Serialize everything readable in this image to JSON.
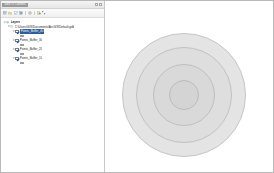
{
  "window": {
    "background": "#ffffff",
    "border_color": "#b9b9b9"
  },
  "toc_panel": {
    "title": "Table Of Contents",
    "pin_button_label": "",
    "close_button_label": "",
    "toolbar": {
      "items": [
        {
          "name": "list-by-drawing-order-icon",
          "label": "List By Drawing Order"
        },
        {
          "name": "list-by-source-icon",
          "label": "List By Source"
        },
        {
          "name": "list-by-visibility-icon",
          "label": "List By Visibility"
        },
        {
          "name": "list-by-selection-icon",
          "label": "List By Selection"
        },
        {
          "name": "options-icon",
          "label": "Options"
        },
        {
          "name": "add-data-icon",
          "label": "Add Data"
        },
        {
          "name": "toggle-all-icon",
          "label": "Toggle All Layers"
        }
      ]
    },
    "tree": [
      {
        "id": "layers-root",
        "indent": 0,
        "label": "Layers",
        "expanded": true,
        "checked": true,
        "selected": false,
        "kind": "root",
        "has_symbol": false
      },
      {
        "id": "gdb-group",
        "indent": 1,
        "label": "C:\\Users\\GIS\\Documents\\ArcGIS\\Default.gdb",
        "expanded": true,
        "checked": true,
        "selected": false,
        "kind": "group",
        "has_symbol": false
      },
      {
        "id": "points-buffer-4",
        "indent": 2,
        "label": "Points_Buffer_40",
        "expanded": true,
        "checked": true,
        "selected": true,
        "kind": "layer",
        "has_symbol": true,
        "symbol_fill": "#e3e3e3",
        "symbol_outline": "#9d9d9d"
      },
      {
        "id": "points-buffer-3",
        "indent": 2,
        "label": "Points_Buffer_30",
        "expanded": true,
        "checked": true,
        "selected": false,
        "kind": "layer",
        "has_symbol": true,
        "symbol_fill": "#dedede",
        "symbol_outline": "#9d9d9d"
      },
      {
        "id": "points-buffer-2",
        "indent": 2,
        "label": "Points_Buffer_20",
        "expanded": true,
        "checked": true,
        "selected": false,
        "kind": "layer",
        "has_symbol": true,
        "symbol_fill": "#d9d9d9",
        "symbol_outline": "#9d9d9d"
      },
      {
        "id": "points-buffer-10",
        "indent": 2,
        "label": "Points_Buffer_10",
        "expanded": true,
        "checked": true,
        "selected": false,
        "kind": "layer",
        "has_symbol": true,
        "symbol_fill": "#d2d2d2",
        "symbol_outline": "#9d9d9d"
      }
    ]
  },
  "map_view": {
    "background": "#ffffff",
    "graphic": {
      "type": "multi-ring-buffer",
      "center_x_pct": 47,
      "center_y_pct": 55,
      "rings": [
        {
          "name": "buffer-ring-40",
          "diameter_px": 124,
          "fill": "#e4e4e4",
          "outline": "#c6c6c6"
        },
        {
          "name": "buffer-ring-30",
          "diameter_px": 96,
          "fill": "#dedede",
          "outline": "#c2c2c2"
        },
        {
          "name": "buffer-ring-20",
          "diameter_px": 62,
          "fill": "#d9d9d9",
          "outline": "#bfbfbf"
        },
        {
          "name": "buffer-ring-10",
          "diameter_px": 30,
          "fill": "#d4d4d4",
          "outline": "#bbbbbb"
        }
      ]
    }
  }
}
